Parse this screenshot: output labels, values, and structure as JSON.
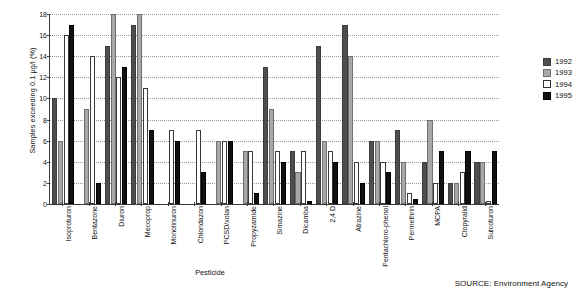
{
  "chart_data": {
    "type": "bar",
    "title": "",
    "xlabel": "Pesticide",
    "ylabel": "Samples exceeding 0.1 µg/l (%)",
    "ylim": [
      0,
      18
    ],
    "yticks": [
      0,
      2,
      4,
      6,
      8,
      10,
      12,
      14,
      16,
      18
    ],
    "grid": true,
    "legend_position": "right",
    "categories": [
      "Isoproturon",
      "Bentazone",
      "Diuron",
      "Mecoprop",
      "Monolinuron",
      "Chloridazon",
      "PCSD/xolan",
      "Propyzamide",
      "Simazine",
      "Dicamba",
      "2,4 D",
      "Atrazine",
      "Pentachloro-phenol",
      "Permethrin",
      "MCPA",
      "Clopyralid",
      "Sulcoturon"
    ],
    "series": [
      {
        "name": "1992",
        "color": "#4e4e4e",
        "values": [
          10,
          0,
          15,
          17,
          0,
          0,
          0,
          0,
          13,
          5,
          15,
          17,
          6,
          7,
          4,
          2,
          4
        ]
      },
      {
        "name": "1993",
        "color": "#a8a8a8",
        "values": [
          6,
          9,
          18,
          18,
          0,
          0,
          6,
          5,
          9,
          3,
          6,
          14,
          6,
          4,
          8,
          2,
          4
        ]
      },
      {
        "name": "1994",
        "color": "#ffffff",
        "values": [
          16,
          14,
          12,
          11,
          7,
          7,
          6,
          5,
          5,
          5,
          5,
          4,
          4,
          1,
          2,
          3,
          0.3
        ]
      },
      {
        "name": "1995",
        "color": "#111111",
        "values": [
          17,
          2,
          13,
          7,
          6,
          3,
          6,
          1,
          4,
          0.3,
          4,
          2,
          3,
          0.5,
          5,
          5,
          5
        ]
      }
    ]
  },
  "legend": {
    "entries": [
      {
        "label": "1992"
      },
      {
        "label": "1993"
      },
      {
        "label": "1994"
      },
      {
        "label": "1995"
      }
    ]
  },
  "source": {
    "text": "SOURCE: Environment Agency"
  }
}
